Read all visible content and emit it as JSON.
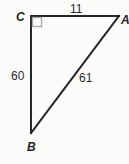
{
  "figure": {
    "shape": "right-triangle",
    "background_color": "#fbfbfa",
    "stroke_color": "#262626",
    "stroke_width": 2,
    "right_angle_marker_color": "#a8a8a8",
    "width": 129,
    "height": 164
  },
  "vertices": {
    "c": {
      "label": "C",
      "x": 31,
      "y": 16
    },
    "a": {
      "label": "A",
      "x": 119,
      "y": 16
    },
    "b": {
      "label": "B",
      "x": 31,
      "y": 133
    }
  },
  "sides": {
    "ca": {
      "label": "11",
      "value": 11,
      "from": "C",
      "to": "A",
      "role": "horizontal-leg"
    },
    "cb": {
      "label": "60",
      "value": 60,
      "from": "C",
      "to": "B",
      "role": "vertical-leg"
    },
    "ab": {
      "label": "61",
      "value": 61,
      "from": "A",
      "to": "B",
      "role": "hypotenuse"
    }
  },
  "right_angle": {
    "at_vertex": "C",
    "marker": "square",
    "size": 9
  }
}
